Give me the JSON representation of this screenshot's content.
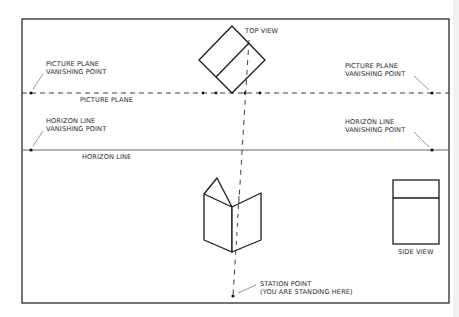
{
  "diagram": {
    "labels": {
      "top_view": "TOP VIEW",
      "pp_vp_left_line1": "PICTURE PLANE",
      "pp_vp_left_line2": "VANISHING POINT",
      "pp_vp_right_line1": "PICTURE PLANE",
      "pp_vp_right_line2": "VANISHING POINT",
      "picture_plane": "PICTURE PLANE",
      "hl_vp_left_line1": "HORIZON LINE",
      "hl_vp_left_line2": "VANISHING POINT",
      "hl_vp_right_line1": "HORIZON LINE",
      "hl_vp_right_line2": "VANISHING POINT",
      "horizon_line": "HORIZON LINE",
      "side_view": "SIDE VIEW",
      "station_point_line1": "STATION POINT",
      "station_point_line2": "(YOU ARE STANDING HERE)"
    },
    "colors": {
      "line": "#2a2a2a",
      "background": "#ffffff",
      "horizon": "#555555"
    },
    "elements": [
      "frame",
      "picture-plane (dashed)",
      "horizon-line (solid)",
      "top-view (rotated square)",
      "perspective-box (3D house shape)",
      "side-view (rectangle)",
      "station-point",
      "sight-line (dashed)"
    ]
  }
}
